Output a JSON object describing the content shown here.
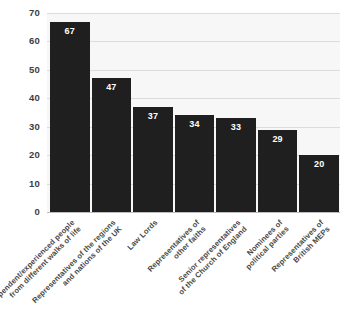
{
  "chart_data": {
    "type": "bar",
    "title": "",
    "subtitle": "",
    "xlabel": "",
    "ylabel": "",
    "ylim": [
      0,
      70
    ],
    "grid": true,
    "legend": false,
    "orientation": "vertical",
    "bar_color": "#1f1f1f",
    "plot_background": "#f7f7f7",
    "gridline_color": "#dcdcdc",
    "value_label_color": "#ffffff",
    "y_ticks": [
      0,
      10,
      20,
      30,
      40,
      50,
      60,
      70
    ],
    "y_tick_labels": [
      "0",
      "10",
      "20",
      "30",
      "40",
      "50",
      "60",
      "70"
    ],
    "categories": [
      "Independent/experienced people from different walks of life",
      "Representatives of the regions and nations of the UK",
      "Law Lords",
      "Representatives of other faiths",
      "Senior representatives of the Church of England",
      "Nominees of political parties",
      "Representatives of British MEPs"
    ],
    "category_lines": [
      [
        "Independent/experienced people",
        "from different walks of life"
      ],
      [
        "Representatives of the regions",
        "and nations of the UK"
      ],
      [
        "Law Lords"
      ],
      [
        "Representatives of",
        "other faiths"
      ],
      [
        "Senior representatives",
        "of the Church of England"
      ],
      [
        "Nominees of",
        "political parties"
      ],
      [
        "Representatives of",
        "British MEPs"
      ]
    ],
    "values": [
      67,
      47,
      37,
      34,
      33,
      29,
      20
    ],
    "value_labels": [
      "67",
      "47",
      "37",
      "34",
      "33",
      "29",
      "20"
    ]
  }
}
